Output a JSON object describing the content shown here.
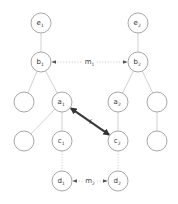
{
  "diagram": {
    "nodes": [
      {
        "id": "e1",
        "base": "e",
        "sub": "1",
        "x": 41,
        "y": 23
      },
      {
        "id": "e2",
        "base": "e",
        "sub": "2",
        "x": 138,
        "y": 23
      },
      {
        "id": "b1",
        "base": "b",
        "sub": "1",
        "x": 41,
        "y": 62
      },
      {
        "id": "b2",
        "base": "b",
        "sub": "2",
        "x": 138,
        "y": 62
      },
      {
        "id": "n_l1",
        "base": "",
        "sub": "",
        "x": 24,
        "y": 102
      },
      {
        "id": "a1",
        "base": "a",
        "sub": "1",
        "x": 62,
        "y": 102
      },
      {
        "id": "a2",
        "base": "a",
        "sub": "2",
        "x": 118,
        "y": 102
      },
      {
        "id": "n_r1",
        "base": "",
        "sub": "",
        "x": 157,
        "y": 102
      },
      {
        "id": "n_l2",
        "base": "",
        "sub": "",
        "x": 24,
        "y": 141
      },
      {
        "id": "c1",
        "base": "c",
        "sub": "1",
        "x": 62,
        "y": 141
      },
      {
        "id": "c2",
        "base": "c",
        "sub": "2",
        "x": 118,
        "y": 141
      },
      {
        "id": "n_r2",
        "base": "",
        "sub": "",
        "x": 157,
        "y": 141
      },
      {
        "id": "d1",
        "base": "d",
        "sub": "1",
        "x": 62,
        "y": 181
      },
      {
        "id": "d2",
        "base": "d",
        "sub": "2",
        "x": 118,
        "y": 181
      }
    ],
    "edges": [
      {
        "from": "e1",
        "to": "b1",
        "style": "solid"
      },
      {
        "from": "e2",
        "to": "b2",
        "style": "solid"
      },
      {
        "from": "b1",
        "to": "n_l1",
        "style": "solid"
      },
      {
        "from": "b1",
        "to": "a1",
        "style": "solid"
      },
      {
        "from": "b2",
        "to": "a2",
        "style": "solid"
      },
      {
        "from": "b2",
        "to": "n_r1",
        "style": "solid"
      },
      {
        "from": "a1",
        "to": "n_l2",
        "style": "solid"
      },
      {
        "from": "a1",
        "to": "c1",
        "style": "solid"
      },
      {
        "from": "a2",
        "to": "c2",
        "style": "solid"
      },
      {
        "from": "n_r1",
        "to": "n_r2",
        "style": "solid"
      },
      {
        "from": "c1",
        "to": "d1",
        "style": "dotted"
      },
      {
        "from": "c2",
        "to": "d2",
        "style": "dotted"
      }
    ],
    "mappings": [
      {
        "from": "b1",
        "to": "b2",
        "label": "m",
        "sub": "1",
        "style": "dotted-bidirectional"
      },
      {
        "from": "d1",
        "to": "d2",
        "label": "m",
        "sub": "2",
        "style": "dotted-bidirectional"
      }
    ],
    "highlight_link": {
      "from": "a1",
      "to": "c2",
      "label": "f",
      "style": "thick-bidirectional"
    },
    "colors": {
      "node_stroke": "#a8a8a8",
      "edge": "#c4c4c4",
      "highlight": "#3a3a3a",
      "text": "#333333"
    }
  }
}
